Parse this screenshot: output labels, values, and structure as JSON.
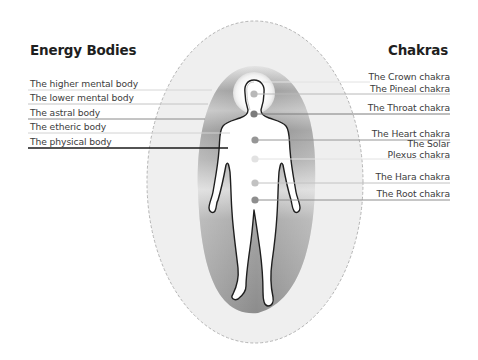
{
  "headings": {
    "left": "Energy Bodies",
    "right": "Chakras"
  },
  "energy_bodies": [
    {
      "label": "The higher mental body",
      "line_y": 90,
      "color": "#d6d6d6",
      "line_end_x": 212
    },
    {
      "label": "The lower mental body",
      "line_y": 104,
      "color": "#c4c4c4",
      "line_end_x": 208
    },
    {
      "label": "The astral body",
      "line_y": 119,
      "color": "#8a8a8a",
      "line_end_x": 205
    },
    {
      "label": "The etheric body",
      "line_y": 133,
      "color": "#d2d2d2",
      "line_end_x": 230
    },
    {
      "label": "The physical body",
      "line_y": 148,
      "color": "#1a1a1a",
      "line_end_x": 228
    }
  ],
  "chakras": [
    {
      "label": "The Crown chakra",
      "label_y": 71,
      "line_y": 82,
      "dot": null,
      "dot_color": null,
      "line_start_x": 262
    },
    {
      "label": "The Pineal chakra",
      "label_y": 83,
      "line_y": 94,
      "dot": [
        254,
        94
      ],
      "dot_color": "#b8b8b8",
      "line_start_x": 254
    },
    {
      "label": "The Throat chakra",
      "label_y": 102,
      "line_y": 114,
      "dot": [
        254,
        114
      ],
      "dot_color": "#7c7c7c",
      "line_start_x": 254
    },
    {
      "label": "The Heart chakra",
      "label_y": 128,
      "line_y": 140,
      "dot": [
        255,
        140
      ],
      "dot_color": "#969696",
      "line_start_x": 255
    },
    {
      "label": "The Solar",
      "label2": "Plexus chakra",
      "label_y": 138,
      "line_y": 159,
      "dot": [
        255,
        159
      ],
      "dot_color": "#e2e2e2",
      "line_start_x": 255
    },
    {
      "label": "The Hara chakra",
      "label_y": 171,
      "line_y": 183,
      "dot": [
        255,
        183
      ],
      "dot_color": "#c2c2c2",
      "line_start_x": 255
    },
    {
      "label": "The Root chakra",
      "label_y": 188,
      "line_y": 200,
      "dot": [
        255,
        200
      ],
      "dot_color": "#8e8e8e",
      "line_start_x": 255
    }
  ],
  "figure": {
    "outer_ellipse": {
      "cx": 255,
      "cy": 182,
      "rx": 108,
      "ry": 161,
      "fill": "#efefef",
      "stroke": "#b4b4b4"
    },
    "halo": {
      "cx": 254,
      "cy": 93,
      "r": 20
    },
    "line_right_end_x": 450,
    "colors": {
      "aura_dark": "#8c8c8c",
      "aura_mid": "#a9a9a9",
      "aura_light": "#d9d9d9",
      "body_outline": "#1e1e1e"
    }
  }
}
